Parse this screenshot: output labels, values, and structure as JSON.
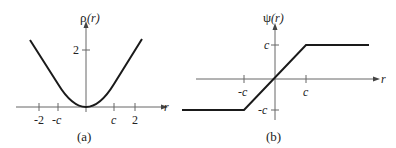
{
  "panels": [
    {
      "id": "a",
      "caption": "(a)",
      "ylabel_fn": "ρ",
      "ylabel_arg": "(r)",
      "xlabel": "r",
      "x_ticks": [
        "-2",
        "-c",
        "c",
        "2"
      ],
      "y_ticks": [
        "2"
      ]
    },
    {
      "id": "b",
      "caption": "(b)",
      "ylabel_fn": "ψ",
      "ylabel_arg": "(r)",
      "xlabel": "r",
      "x_ticks": [
        "-c",
        "c"
      ],
      "y_ticks": [
        "c",
        "-c"
      ]
    }
  ],
  "colors": {
    "line": "#1a1a1a",
    "axis": "#555555"
  }
}
